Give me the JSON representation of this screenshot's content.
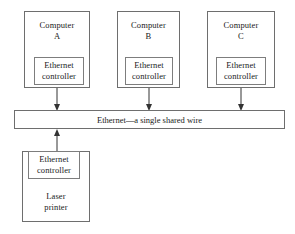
{
  "diagram": {
    "bus": {
      "label": "Ethernet—a single shared wire",
      "name": "ethernet-bus"
    },
    "nodes": [
      {
        "id": "computer-a",
        "label": "Computer\nA",
        "controller_label": "Ethernet\ncontroller",
        "connector_direction": "down"
      },
      {
        "id": "computer-b",
        "label": "Computer\nB",
        "controller_label": "Ethernet\ncontroller",
        "connector_direction": "down"
      },
      {
        "id": "computer-c",
        "label": "Computer\nC",
        "controller_label": "Ethernet\ncontroller",
        "connector_direction": "down"
      },
      {
        "id": "laser-printer",
        "label": "Laser\nprinter",
        "controller_label": "Ethernet\ncontroller",
        "connector_direction": "up"
      }
    ],
    "colors": {
      "background": "#ffffff",
      "stroke": "#6e6e6e",
      "text": "#1a1a1a",
      "connector": "#333333"
    }
  }
}
